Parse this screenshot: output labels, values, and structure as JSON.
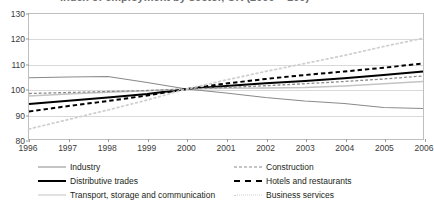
{
  "caption": {
    "text": "Index of employment by sector, UK (2000 = 100)"
  },
  "chart_data": {
    "type": "line",
    "title": "",
    "subtitle": "",
    "xlabel": "",
    "ylabel": "",
    "x": [
      1996,
      1997,
      1998,
      1999,
      2000,
      2001,
      2002,
      2003,
      2004,
      2005,
      2006
    ],
    "xtick_labels": [
      "1996",
      "1997",
      "1998",
      "1999",
      "2000",
      "2001",
      "2002",
      "2003",
      "2004",
      "2005",
      "2006"
    ],
    "ytick_labels": [
      "80",
      "90",
      "100",
      "110",
      "120",
      "130"
    ],
    "yticks": [
      80,
      90,
      100,
      110,
      120,
      130
    ],
    "ylim": [
      80,
      130
    ],
    "xlim": [
      1996,
      2006
    ],
    "grid": true,
    "legend_position": "bottom",
    "legend_columns": 2,
    "base_index": 100,
    "base_year": 2000,
    "series": [
      {
        "name": "Industry",
        "style": "solid",
        "color": "#8a8a8a",
        "width": 1.1,
        "values": [
          104.5,
          104.8,
          105.0,
          102.6,
          100.0,
          98.4,
          96.6,
          95.2,
          94.2,
          92.6,
          92.2
        ]
      },
      {
        "name": "Distributive trades",
        "style": "solid",
        "color": "#000000",
        "width": 2.1,
        "values": [
          94.0,
          95.3,
          96.6,
          98.0,
          100.0,
          101.2,
          102.3,
          103.2,
          104.3,
          105.6,
          107.0
        ]
      },
      {
        "name": "Transport, storage and communication",
        "style": "solid",
        "color": "#c4c4c4",
        "width": 1.3,
        "values": [
          97.2,
          98.0,
          98.7,
          99.3,
          100.0,
          100.3,
          100.4,
          100.6,
          101.2,
          102.1,
          103.0
        ]
      },
      {
        "name": "Construction",
        "style": "dashed",
        "color": "#8a8a8a",
        "width": 1.3,
        "values": [
          98.2,
          98.6,
          99.0,
          99.4,
          100.0,
          100.6,
          101.3,
          102.1,
          103.0,
          104.0,
          105.2
        ]
      },
      {
        "name": "Hotels and restaurants",
        "style": "dashed",
        "color": "#000000",
        "width": 2.0,
        "values": [
          91.0,
          93.2,
          95.2,
          97.4,
          100.0,
          102.2,
          104.0,
          105.6,
          107.0,
          108.5,
          110.2
        ]
      },
      {
        "name": "Business services",
        "style": "dotted",
        "color": "#cfcfcf",
        "width": 1.8,
        "values": [
          84.0,
          87.8,
          91.6,
          95.6,
          100.0,
          103.6,
          107.0,
          110.2,
          113.4,
          117.0,
          120.3
        ]
      }
    ]
  },
  "legend": {
    "left_column": [
      {
        "label": "Industry"
      },
      {
        "label": "Distributive trades"
      },
      {
        "label": "Transport, storage and communication"
      }
    ],
    "right_column": [
      {
        "label": "Construction"
      },
      {
        "label": "Hotels and restaurants"
      },
      {
        "label": "Business services"
      }
    ]
  }
}
